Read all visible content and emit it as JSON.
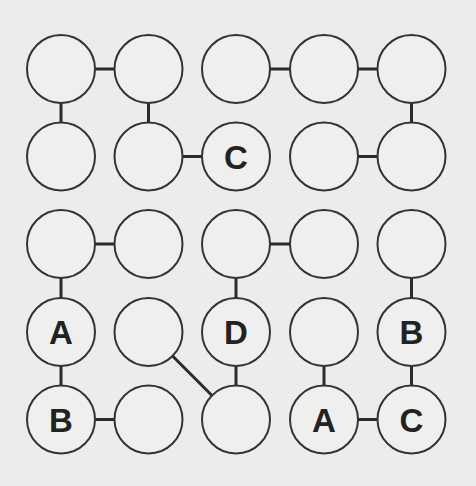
{
  "puzzle": {
    "grid": {
      "rows": 5,
      "cols": 5
    },
    "colors": {
      "background": "#ececea",
      "stroke": "#333333",
      "text": "#222222"
    },
    "nodes": [
      {
        "id": "r0c0",
        "row": 0,
        "col": 0,
        "label": ""
      },
      {
        "id": "r0c1",
        "row": 0,
        "col": 1,
        "label": ""
      },
      {
        "id": "r0c2",
        "row": 0,
        "col": 2,
        "label": ""
      },
      {
        "id": "r0c3",
        "row": 0,
        "col": 3,
        "label": ""
      },
      {
        "id": "r0c4",
        "row": 0,
        "col": 4,
        "label": ""
      },
      {
        "id": "r1c0",
        "row": 1,
        "col": 0,
        "label": ""
      },
      {
        "id": "r1c1",
        "row": 1,
        "col": 1,
        "label": ""
      },
      {
        "id": "r1c2",
        "row": 1,
        "col": 2,
        "label": "C"
      },
      {
        "id": "r1c3",
        "row": 1,
        "col": 3,
        "label": ""
      },
      {
        "id": "r1c4",
        "row": 1,
        "col": 4,
        "label": ""
      },
      {
        "id": "r2c0",
        "row": 2,
        "col": 0,
        "label": ""
      },
      {
        "id": "r2c1",
        "row": 2,
        "col": 1,
        "label": ""
      },
      {
        "id": "r2c2",
        "row": 2,
        "col": 2,
        "label": ""
      },
      {
        "id": "r2c3",
        "row": 2,
        "col": 3,
        "label": ""
      },
      {
        "id": "r2c4",
        "row": 2,
        "col": 4,
        "label": ""
      },
      {
        "id": "r3c0",
        "row": 3,
        "col": 0,
        "label": "A"
      },
      {
        "id": "r3c1",
        "row": 3,
        "col": 1,
        "label": ""
      },
      {
        "id": "r3c2",
        "row": 3,
        "col": 2,
        "label": "D"
      },
      {
        "id": "r3c3",
        "row": 3,
        "col": 3,
        "label": ""
      },
      {
        "id": "r3c4",
        "row": 3,
        "col": 4,
        "label": "B"
      },
      {
        "id": "r4c0",
        "row": 4,
        "col": 0,
        "label": "B"
      },
      {
        "id": "r4c1",
        "row": 4,
        "col": 1,
        "label": ""
      },
      {
        "id": "r4c2",
        "row": 4,
        "col": 2,
        "label": ""
      },
      {
        "id": "r4c3",
        "row": 4,
        "col": 3,
        "label": "A"
      },
      {
        "id": "r4c4",
        "row": 4,
        "col": 4,
        "label": "C"
      }
    ],
    "edges": [
      [
        "r0c0",
        "r0c1"
      ],
      [
        "r0c2",
        "r0c3"
      ],
      [
        "r0c3",
        "r0c4"
      ],
      [
        "r0c0",
        "r1c0"
      ],
      [
        "r0c1",
        "r1c1"
      ],
      [
        "r0c4",
        "r1c4"
      ],
      [
        "r1c1",
        "r1c2"
      ],
      [
        "r1c3",
        "r1c4"
      ],
      [
        "r2c0",
        "r2c1"
      ],
      [
        "r2c2",
        "r2c3"
      ],
      [
        "r2c0",
        "r3c0"
      ],
      [
        "r2c2",
        "r3c2"
      ],
      [
        "r2c4",
        "r3c4"
      ],
      [
        "r3c0",
        "r4c0"
      ],
      [
        "r3c2",
        "r4c2"
      ],
      [
        "r3c3",
        "r4c3"
      ],
      [
        "r3c4",
        "r4c4"
      ],
      [
        "r3c1",
        "r4c2"
      ],
      [
        "r4c0",
        "r4c1"
      ],
      [
        "r4c3",
        "r4c4"
      ]
    ]
  }
}
